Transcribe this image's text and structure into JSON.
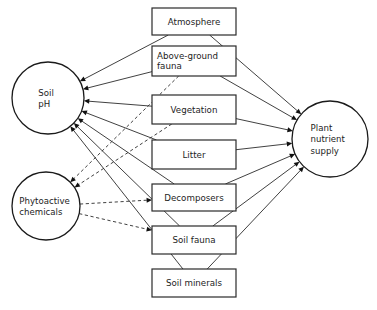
{
  "diagram": {
    "canvas": {
      "width": 377,
      "height": 310,
      "background": "#ffffff"
    },
    "colors": {
      "stroke": "#2b2b2b",
      "node_stroke": "#1a1a1a",
      "box_stroke": "#2a2a2a",
      "text": "#1d1d1d",
      "arrow": "#111111",
      "background": "#ffffff"
    },
    "circles": [
      {
        "id": "soil-ph",
        "lines": [
          "Soil",
          "pH"
        ],
        "cx": 48,
        "cy": 98,
        "r": 36
      },
      {
        "id": "phytoactive-chemicals",
        "lines": [
          "Phytoactive",
          "chemicals"
        ],
        "cx": 46,
        "cy": 206,
        "r": 34
      },
      {
        "id": "plant-nutrient-supply",
        "lines": [
          "Plant",
          "nutrient",
          "supply"
        ],
        "cx": 330,
        "cy": 139,
        "r": 38
      }
    ],
    "boxes": [
      {
        "id": "atmosphere",
        "lines": [
          "Atmosphere"
        ],
        "align": "center",
        "x": 152,
        "y": 8,
        "w": 84,
        "h": 27
      },
      {
        "id": "above-ground-fauna",
        "lines": [
          "Above-ground",
          "fauna"
        ],
        "align": "left",
        "x": 152,
        "y": 46,
        "w": 84,
        "h": 30
      },
      {
        "id": "vegetation",
        "lines": [
          "Vegetation"
        ],
        "align": "center",
        "x": 152,
        "y": 95,
        "w": 84,
        "h": 29
      },
      {
        "id": "litter",
        "lines": [
          "Litter"
        ],
        "align": "center",
        "x": 152,
        "y": 140,
        "w": 84,
        "h": 29
      },
      {
        "id": "decomposers",
        "lines": [
          "Decomposers"
        ],
        "align": "center",
        "x": 152,
        "y": 184,
        "w": 84,
        "h": 27
      },
      {
        "id": "soil-fauna",
        "lines": [
          "Soil fauna"
        ],
        "align": "center",
        "x": 152,
        "y": 226,
        "w": 84,
        "h": 28
      },
      {
        "id": "soil-minerals",
        "lines": [
          "Soil minerals"
        ],
        "align": "center",
        "x": 152,
        "y": 269,
        "w": 84,
        "h": 28
      }
    ],
    "edges": [
      {
        "id": "e-atmosphere-to-soilph",
        "from": "atmosphere",
        "to": "soil-ph",
        "style": "solid",
        "arrow": "end"
      },
      {
        "id": "e-agfauna-to-soilph",
        "from": "above-ground-fauna",
        "to": "soil-ph",
        "style": "solid",
        "arrow": "end"
      },
      {
        "id": "e-vegetation-to-soilph",
        "from": "vegetation",
        "to": "soil-ph",
        "style": "solid",
        "arrow": "end"
      },
      {
        "id": "e-litter-to-soilph",
        "from": "litter",
        "to": "soil-ph",
        "style": "solid",
        "arrow": "end"
      },
      {
        "id": "e-decomposers-to-soilph",
        "from": "decomposers",
        "to": "soil-ph",
        "style": "solid",
        "arrow": "end"
      },
      {
        "id": "e-soilfauna-to-soilph",
        "from": "soil-fauna",
        "to": "soil-ph",
        "style": "solid",
        "arrow": "end"
      },
      {
        "id": "e-soilminerals-to-soilph",
        "from": "soil-minerals",
        "to": "soil-ph",
        "style": "solid",
        "arrow": "end"
      },
      {
        "id": "e-agfauna-to-phyto",
        "from": "above-ground-fauna",
        "to": "phytoactive-chemicals",
        "style": "dashed",
        "arrow": "end"
      },
      {
        "id": "e-vegetation-to-phyto",
        "from": "vegetation",
        "to": "phytoactive-chemicals",
        "style": "dashed",
        "arrow": "end"
      },
      {
        "id": "e-phyto-to-decomposers",
        "from": "phytoactive-chemicals",
        "to": "decomposers",
        "style": "dashed",
        "arrow": "end"
      },
      {
        "id": "e-phyto-to-soilfauna",
        "from": "phytoactive-chemicals",
        "to": "soil-fauna",
        "style": "dashed",
        "arrow": "end"
      },
      {
        "id": "e-atmosphere-to-plant",
        "from": "atmosphere",
        "to": "plant-nutrient-supply",
        "style": "solid",
        "arrow": "end"
      },
      {
        "id": "e-agfauna-to-plant",
        "from": "above-ground-fauna",
        "to": "plant-nutrient-supply",
        "style": "solid",
        "arrow": "end"
      },
      {
        "id": "e-vegetation-to-plant",
        "from": "vegetation",
        "to": "plant-nutrient-supply",
        "style": "solid",
        "arrow": "end"
      },
      {
        "id": "e-litter-to-plant",
        "from": "litter",
        "to": "plant-nutrient-supply",
        "style": "solid",
        "arrow": "end"
      },
      {
        "id": "e-decomposers-to-plant",
        "from": "decomposers",
        "to": "plant-nutrient-supply",
        "style": "solid",
        "arrow": "end"
      },
      {
        "id": "e-soilfauna-to-plant",
        "from": "soil-fauna",
        "to": "plant-nutrient-supply",
        "style": "solid",
        "arrow": "end"
      },
      {
        "id": "e-soilminerals-to-plant",
        "from": "soil-minerals",
        "to": "plant-nutrient-supply",
        "style": "solid",
        "arrow": "end"
      }
    ]
  }
}
